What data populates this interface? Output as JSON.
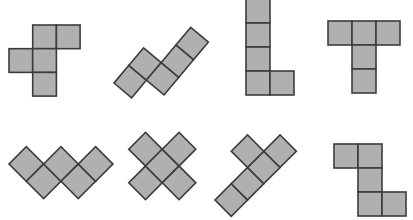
{
  "diagram": {
    "colors": {
      "fill": "#b0b0b0",
      "stroke": "#3c3c3c",
      "background": "#ffffff"
    },
    "shapes": [
      {
        "id": "shape-1",
        "name": "f-pentomino",
        "origin": [
          9,
          25
        ],
        "size": 23.7,
        "rotate": 0,
        "cells": [
          [
            1,
            0
          ],
          [
            2,
            0
          ],
          [
            0,
            1
          ],
          [
            1,
            1
          ],
          [
            1,
            2
          ]
        ]
      },
      {
        "id": "shape-2",
        "name": "n-pentomino-diagonal",
        "origin": [
          114,
          83
        ],
        "size": 23,
        "rotate": -50,
        "cells": [
          [
            0,
            0
          ],
          [
            1,
            0
          ],
          [
            1,
            1
          ],
          [
            2,
            1
          ],
          [
            3,
            1
          ]
        ]
      },
      {
        "id": "shape-3",
        "name": "l-pentomino",
        "origin": [
          246,
          -1
        ],
        "size": 24,
        "rotate": 0,
        "cells": [
          [
            0,
            0
          ],
          [
            0,
            1
          ],
          [
            0,
            2
          ],
          [
            0,
            3
          ],
          [
            1,
            3
          ]
        ]
      },
      {
        "id": "shape-4",
        "name": "t-pentomino",
        "origin": [
          328,
          21
        ],
        "size": 24,
        "rotate": 0,
        "cells": [
          [
            0,
            0
          ],
          [
            1,
            0
          ],
          [
            2,
            0
          ],
          [
            1,
            1
          ],
          [
            1,
            2
          ]
        ]
      },
      {
        "id": "shape-5",
        "name": "w-pentomino-diagonal",
        "origin": [
          9,
          164
        ],
        "size": 24.5,
        "rotate": -45,
        "cells": [
          [
            0,
            0
          ],
          [
            0,
            1
          ],
          [
            1,
            1
          ],
          [
            1,
            2
          ],
          [
            2,
            2
          ]
        ]
      },
      {
        "id": "shape-6",
        "name": "x-pentomino-diagonal",
        "origin": [
          112,
          166
        ],
        "size": 23.7,
        "rotate": -45,
        "cells": [
          [
            1,
            0
          ],
          [
            0,
            1
          ],
          [
            1,
            1
          ],
          [
            2,
            1
          ],
          [
            1,
            2
          ]
        ]
      },
      {
        "id": "shape-7",
        "name": "y-pentomino-diagonal",
        "origin": [
          215,
          200
        ],
        "size": 23,
        "rotate": -45,
        "cells": [
          [
            0,
            0
          ],
          [
            1,
            0
          ],
          [
            2,
            0
          ],
          [
            3,
            0
          ],
          [
            2,
            -1
          ]
        ]
      },
      {
        "id": "shape-8",
        "name": "s-tetromino-plus",
        "origin": [
          334,
          144
        ],
        "size": 24,
        "rotate": 0,
        "cells": [
          [
            0,
            0
          ],
          [
            1,
            0
          ],
          [
            1,
            1
          ],
          [
            1,
            2
          ],
          [
            2,
            2
          ]
        ]
      }
    ]
  }
}
